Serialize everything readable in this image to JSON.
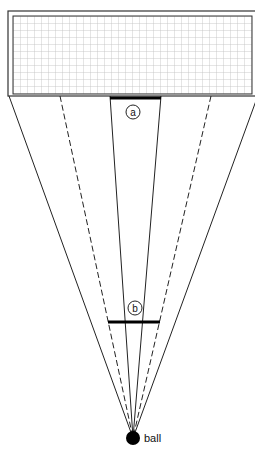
{
  "diagram": {
    "colors": {
      "line": "#222222",
      "grid": "#bfbfbf",
      "frame": "#333333",
      "ball": "#000000",
      "bar": "#000000"
    },
    "goal": {
      "frame": {
        "x": 8,
        "y": 11,
        "w": 252,
        "h": 85
      },
      "net": {
        "x": 13,
        "y": 16,
        "w": 239,
        "h": 78,
        "cell": 7
      }
    },
    "ball": {
      "cx": 133,
      "cy": 438,
      "r": 7,
      "label": "ball"
    },
    "rays": [
      {
        "id": "outer-left",
        "x": 9,
        "y": 96,
        "style": "solid"
      },
      {
        "id": "dashed-left",
        "x": 60,
        "y": 96,
        "style": "dashed"
      },
      {
        "id": "inner-left",
        "x": 110,
        "y": 96,
        "style": "solid"
      },
      {
        "id": "inner-right",
        "x": 161,
        "y": 96,
        "style": "solid"
      },
      {
        "id": "dashed-right",
        "x": 211,
        "y": 96,
        "style": "dashed"
      },
      {
        "id": "outer-right",
        "x": 257,
        "y": 98,
        "style": "solid"
      }
    ],
    "markers": [
      {
        "id": "a",
        "label": "a",
        "bar": {
          "x1": 110,
          "x2": 161,
          "y": 98
        },
        "circle": {
          "cx": 133,
          "cy": 112,
          "r": 7
        }
      },
      {
        "id": "b",
        "label": "b",
        "bar": {
          "x1": 108,
          "x2": 160,
          "y": 322
        },
        "circle": {
          "cx": 135,
          "cy": 308,
          "r": 7
        }
      }
    ]
  }
}
